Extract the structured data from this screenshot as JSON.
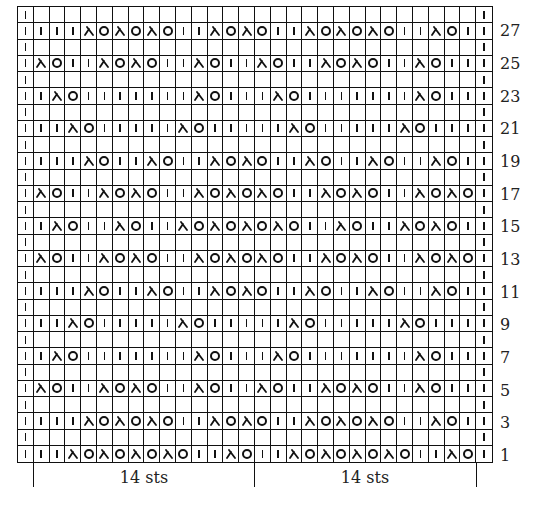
{
  "chart": {
    "columns": 30,
    "rows_total": 28,
    "symbols": {
      "k": "knit-stitch (vertical bar)",
      "o": "yarn-over (circle)",
      "d": "decrease (lambda-shaped slant)",
      "e": "empty"
    },
    "rows": {
      "1": "k k k d o d o d o d o k k d o k k d o d o d o d o k k d o k",
      "2": "k e e e e e e e e e e e e e e e e e e e e e e e e e e e e k",
      "3": "k k k k d o d o d o k k d o d o k k d o d o d o k k d o k k",
      "4": "k e e e e e e e e e e e e e e e e e e e e e e e e e e e e k",
      "5": "k d o k k d o d o k k d o k k d o k k d o d o k k d o k k k",
      "6": "k e e e e e e e e e e e e e e e e e e e e e e e e e e e e k",
      "7": "k k d o k k k k k k k d o k k k d o k k k k k k k d o k k k",
      "8": "k e e e e e e e e e e e e e e e e e e e e e e e e e e e e k",
      "9": "k k k d o k k k k k d o k k k k k d o k k k k k d o k k k k",
      "10": "k e e e e e e e e e e e e e e e e e e e e e e e e e e e e k",
      "11": "k k k k d o k k d o k k d o d o k k d o k k d o k k d o k k",
      "12": "k e e e e e e e e e e e e e e e e e e e e e e e e e e e e k",
      "13": "k d o k k d o d o k k d o d o d o k k d o d o k k d o d o k",
      "14": "k e e e e e e e e e e e e e e e e e e e e e e e e e e e e k",
      "15": "k k d o k k d o k k d o d o d o d o k k d o k k d o d o k k",
      "16": "k e e e e e e e e e e e e e e e e e e e e e e e e e e e e k",
      "17": "k d o k k d o d o k k d o d o d o k k d o d o k k d o d o k",
      "18": "k e e e e e e e e e e e e e e e e e e e e e e e e e e e e k",
      "19": "k k k k d o k k d o k k d o d o k k d o k k d o k k d o k k",
      "20": "k e e e e e e e e e e e e e e e e e e e e e e e e e e e e k",
      "21": "k k k d o k k k k k d o k k k k k d o k k k k k d o k k k k",
      "22": "k e e e e e e e e e e e e e e e e e e e e e e e e e e e e k",
      "23": "k k d o k k k k k k k d o k k k d o k k k k k k k d o k k k",
      "24": "k e e e e e e e e e e e e e e e e e e e e e e e e e e e e k",
      "25": "k d o k k d o d o k k d o k k d o k k d o d o k k d o k k k",
      "26": "k e e e e e e e e e e e e e e e e e e e e e e e e e e e e k",
      "27": "k k k k d o d o d o k k d o d o k k d o d o d o k k d o k k",
      "28": "k e e e e e e e e e e e e e e e e e e e e e e e e e e e e k"
    },
    "row_labels": [
      "27",
      "25",
      "23",
      "21",
      "19",
      "17",
      "15",
      "13",
      "11",
      "9",
      "7",
      "5",
      "3",
      "1"
    ],
    "repeat_labels": [
      "14 sts",
      "14 sts"
    ]
  }
}
